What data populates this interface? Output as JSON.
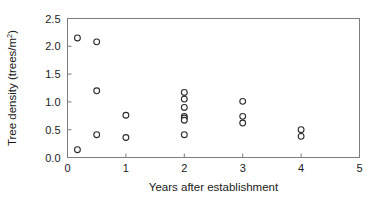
{
  "chart_data": {
    "type": "scatter",
    "title": "",
    "xlabel": "Years after establishment",
    "ylabel": "Tree density (trees/m²)",
    "ylabel_base": "Tree density (trees/m",
    "ylabel_sup": "2",
    "ylabel_close": ")",
    "xlim": [
      0,
      5
    ],
    "ylim": [
      0.0,
      2.5
    ],
    "grid": false,
    "legend": null,
    "marker": "open-circle",
    "marker_color": "#2b2b2b",
    "xticks": [
      "0",
      "1",
      "2",
      "3",
      "4",
      "5"
    ],
    "xtick_values": [
      0,
      1,
      2,
      3,
      4,
      5
    ],
    "yticks": [
      "0.0",
      "0.5",
      "1.0",
      "1.5",
      "2.0",
      "2.5"
    ],
    "ytick_values": [
      0.0,
      0.5,
      1.0,
      1.5,
      2.0,
      2.5
    ],
    "series": [
      {
        "name": "Tree density observations",
        "points": [
          [
            0.17,
            2.15
          ],
          [
            0.17,
            0.14
          ],
          [
            0.5,
            2.08
          ],
          [
            0.5,
            1.2
          ],
          [
            0.5,
            0.41
          ],
          [
            1.0,
            0.76
          ],
          [
            1.0,
            0.36
          ],
          [
            2.0,
            1.17
          ],
          [
            2.0,
            1.05
          ],
          [
            2.0,
            0.9
          ],
          [
            2.0,
            0.74
          ],
          [
            2.0,
            0.71
          ],
          [
            2.0,
            0.67
          ],
          [
            2.0,
            0.41
          ],
          [
            3.0,
            1.01
          ],
          [
            3.0,
            0.74
          ],
          [
            3.0,
            0.62
          ],
          [
            4.0,
            0.5
          ],
          [
            4.0,
            0.38
          ]
        ]
      }
    ]
  }
}
